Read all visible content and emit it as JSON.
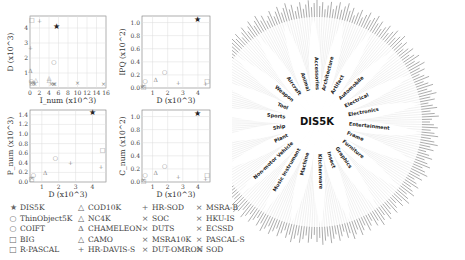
{
  "chart_data": [
    {
      "type": "scatter",
      "panel": "top-left",
      "xlabel": "I_num (x10^3)",
      "ylabel": "D (x10^3)",
      "xticks": [
        "0",
        "2",
        "4",
        "6",
        "8",
        "10",
        "12",
        "14",
        "16"
      ],
      "yticks": [
        "1",
        "2",
        "3",
        "4"
      ],
      "xlim": [
        0,
        16
      ],
      "ylim": [
        0,
        4.8
      ],
      "grid": true,
      "points": [
        {
          "dataset": "DIS5K",
          "x": 5.5,
          "y": 4.1
        },
        {
          "dataset": "ThinObject5K",
          "x": 5.0,
          "y": 1.8
        },
        {
          "dataset": "COIFT",
          "x": 0.3,
          "y": 0.5
        },
        {
          "dataset": "BIG",
          "x": 0.4,
          "y": 4.6
        },
        {
          "dataset": "R-PASCAL",
          "x": 0.5,
          "y": 0.4
        },
        {
          "dataset": "COD10K",
          "x": 4.0,
          "y": 0.7
        },
        {
          "dataset": "NC4K",
          "x": 4.0,
          "y": 0.6
        },
        {
          "dataset": "CHAMELEON",
          "x": 0.1,
          "y": 1.2
        },
        {
          "dataset": "CAMO",
          "x": 1.2,
          "y": 0.6
        },
        {
          "dataset": "HR-SOD",
          "x": 2.0,
          "y": 4.5
        },
        {
          "dataset": "HR-DAVIS-S",
          "x": 0.1,
          "y": 2.7
        },
        {
          "dataset": "SOC",
          "x": 5.0,
          "y": 0.3
        },
        {
          "dataset": "DUTS",
          "x": 15.5,
          "y": 0.3
        },
        {
          "dataset": "MSRA10K",
          "x": 10.0,
          "y": 0.4
        },
        {
          "dataset": "DUT-OMRON",
          "x": 5.2,
          "y": 0.3
        },
        {
          "dataset": "MSRA-B",
          "x": 5.0,
          "y": 0.3
        },
        {
          "dataset": "HKU-IS",
          "x": 4.5,
          "y": 0.3
        },
        {
          "dataset": "ECSSD",
          "x": 1.0,
          "y": 0.3
        },
        {
          "dataset": "PASCAL-S",
          "x": 0.8,
          "y": 0.4
        },
        {
          "dataset": "SOD",
          "x": 0.3,
          "y": 0.4
        }
      ]
    },
    {
      "type": "scatter",
      "panel": "top-right",
      "xlabel": "D (x10^3)",
      "ylabel": "IPQ (x10^2)",
      "xticks": [
        "1",
        "2",
        "3",
        "4"
      ],
      "yticks": [
        "0.0",
        "0.2",
        "0.4",
        "0.6",
        "0.8",
        "1.0"
      ],
      "xlim": [
        0.3,
        4.8
      ],
      "ylim": [
        0,
        1.1
      ],
      "grid": true,
      "points": [
        {
          "dataset": "DIS5K",
          "x": 4.0,
          "y": 1.04
        },
        {
          "dataset": "ThinObject5K",
          "x": 1.8,
          "y": 0.25
        },
        {
          "dataset": "COIFT",
          "x": 0.5,
          "y": 0.11
        },
        {
          "dataset": "BIG",
          "x": 4.6,
          "y": 0.11
        },
        {
          "dataset": "R-PASCAL",
          "x": 0.4,
          "y": 0.03
        },
        {
          "dataset": "CHAMELEON",
          "x": 1.2,
          "y": 0.13
        },
        {
          "dataset": "HR-DAVIS-S",
          "x": 2.7,
          "y": 0.08
        },
        {
          "dataset": "HR-SOD",
          "x": 4.5,
          "y": 0.07
        },
        {
          "dataset": "SOD",
          "x": 0.4,
          "y": 0.04
        },
        {
          "dataset": "DUTS",
          "x": 0.3,
          "y": 0.03
        }
      ]
    },
    {
      "type": "scatter",
      "panel": "bottom-left",
      "xlabel": "D (x10^3)",
      "ylabel": "P_num (x10^3)",
      "xticks": [
        "1",
        "2",
        "3",
        "4"
      ],
      "yticks": [
        "0.0",
        "0.2",
        "0.4",
        "0.6",
        "0.8",
        "1.0",
        "1.2",
        "1.4"
      ],
      "xlim": [
        0.3,
        4.8
      ],
      "ylim": [
        0,
        1.5
      ],
      "grid": true,
      "points": [
        {
          "dataset": "DIS5K",
          "x": 4.0,
          "y": 1.45
        },
        {
          "dataset": "ThinObject5K",
          "x": 1.8,
          "y": 0.52
        },
        {
          "dataset": "COIFT",
          "x": 0.5,
          "y": 0.15
        },
        {
          "dataset": "BIG",
          "x": 4.6,
          "y": 0.68
        },
        {
          "dataset": "R-PASCAL",
          "x": 0.4,
          "y": 0.08
        },
        {
          "dataset": "CHAMELEON",
          "x": 1.2,
          "y": 0.2
        },
        {
          "dataset": "HR-DAVIS-S",
          "x": 2.7,
          "y": 0.4
        },
        {
          "dataset": "HR-SOD",
          "x": 4.5,
          "y": 0.33
        },
        {
          "dataset": "SOD",
          "x": 0.4,
          "y": 0.1
        }
      ]
    },
    {
      "type": "scatter",
      "panel": "bottom-right",
      "xlabel": "D (x10^3)",
      "ylabel": "C_num (x10^2)",
      "xticks": [
        "1",
        "2",
        "3",
        "4"
      ],
      "yticks": [
        "0.0",
        "0.2",
        "0.4",
        "0.6",
        "0.8",
        "1.0"
      ],
      "xlim": [
        0.3,
        4.8
      ],
      "ylim": [
        0,
        1.1
      ],
      "grid": true,
      "points": [
        {
          "dataset": "DIS5K",
          "x": 4.0,
          "y": 1.05
        },
        {
          "dataset": "ThinObject5K",
          "x": 1.8,
          "y": 0.25
        },
        {
          "dataset": "COIFT",
          "x": 0.5,
          "y": 0.11
        },
        {
          "dataset": "BIG",
          "x": 4.6,
          "y": 0.12
        },
        {
          "dataset": "R-PASCAL",
          "x": 0.4,
          "y": 0.03
        },
        {
          "dataset": "CHAMELEON",
          "x": 1.2,
          "y": 0.14
        },
        {
          "dataset": "HR-DAVIS-S",
          "x": 2.7,
          "y": 0.08
        },
        {
          "dataset": "HR-SOD",
          "x": 4.5,
          "y": 0.06
        },
        {
          "dataset": "SOD",
          "x": 0.4,
          "y": 0.04
        }
      ]
    },
    {
      "type": "radial-tree",
      "panel": "right",
      "title": "DIS5K",
      "groups": [
        "Architecture",
        "Artifact",
        "Automobile",
        "Electrical",
        "Electronics",
        "Entertainment",
        "Frame",
        "Furniture",
        "Graphics",
        "Insect",
        "Kitchenware",
        "Machine",
        "Music Instrument",
        "Non-motor Vehicle",
        "Plant",
        "Ship",
        "Sports",
        "Tool",
        "Weapon",
        "Aircraft",
        "Animal",
        "Accessories"
      ]
    }
  ],
  "legend": {
    "columns": [
      [
        {
          "symbol": "★",
          "label": "DIS5K"
        },
        {
          "symbol": "○",
          "label": "ThinObject5K"
        },
        {
          "symbol": "○",
          "label": "COIFT"
        },
        {
          "symbol": "□",
          "label": "BIG"
        },
        {
          "symbol": "□",
          "label": "R-PASCAL"
        }
      ],
      [
        {
          "symbol": "△",
          "label": "COD10K"
        },
        {
          "symbol": "△",
          "label": "NC4K"
        },
        {
          "symbol": "Δ",
          "label": "CHAMELEON"
        },
        {
          "symbol": "△",
          "label": "CAMO"
        },
        {
          "symbol": "+",
          "label": "HR-DAVIS-S"
        }
      ],
      [
        {
          "symbol": "+",
          "label": "HR-SOD"
        },
        {
          "symbol": "×",
          "label": "SOC"
        },
        {
          "symbol": "×",
          "label": "DUTS"
        },
        {
          "symbol": "×",
          "label": "MSRA10K"
        },
        {
          "symbol": "×",
          "label": "DUT-OMRON"
        }
      ],
      [
        {
          "symbol": "×",
          "label": "MSRA-B"
        },
        {
          "symbol": "×",
          "label": "HKU-IS"
        },
        {
          "symbol": "×",
          "label": "ECSSD"
        },
        {
          "symbol": "×",
          "label": "PASCAL-S"
        },
        {
          "symbol": "×",
          "label": "SOD"
        }
      ]
    ]
  }
}
